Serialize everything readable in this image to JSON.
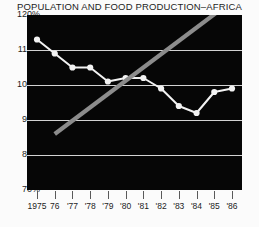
{
  "chart_data": {
    "type": "line",
    "title": "POPULATION AND FOOD PRODUCTION–AFRICA",
    "xlabel": "",
    "ylabel": "",
    "grid": true,
    "legend": "none",
    "background": "#060606",
    "x": [
      1975,
      1976,
      1977,
      1978,
      1979,
      1980,
      1981,
      1982,
      1983,
      1984,
      1985,
      1986
    ],
    "xticklabels": [
      "1975",
      "76",
      "'77",
      "'78",
      "'79",
      "'80",
      "'81",
      "'82",
      "'83",
      "'84",
      "'85",
      "'86"
    ],
    "ylim": [
      70,
      120
    ],
    "yticks": [
      120,
      110,
      100,
      90,
      80,
      70
    ],
    "yticklabels": [
      "120%",
      "110%",
      "100%",
      "90%",
      "80%",
      "70%"
    ],
    "series": [
      {
        "name": "Food production per capita",
        "color": "#f2f2f2",
        "style": "line-with-markers",
        "marker": "circle",
        "values": [
          113,
          109,
          105,
          105,
          101,
          102,
          102,
          99,
          94,
          92,
          98,
          99
        ]
      },
      {
        "name": "Population",
        "color": "#8c8c8c",
        "style": "thick-line",
        "marker": "none",
        "x": [
          1976,
          1986
        ],
        "values": [
          86,
          124
        ]
      }
    ]
  },
  "axes": {
    "y_tick_suffix": "%"
  }
}
